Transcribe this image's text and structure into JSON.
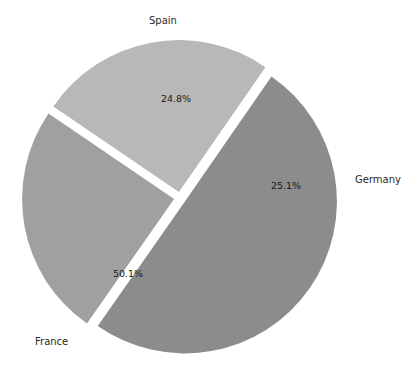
{
  "chart_data": {
    "type": "pie",
    "title": "",
    "categories": [
      "Spain",
      "Germany",
      "France"
    ],
    "values": [
      24.8,
      25.1,
      50.1
    ],
    "value_labels": [
      "24.8%",
      "25.1%",
      "50.1%"
    ],
    "units": "percent",
    "legend": "none",
    "grid": false,
    "exploded": true,
    "slice_colors": [
      "#a0a0a0",
      "#b8b8b8",
      "#8c8c8c"
    ],
    "background_color": "#ffffff",
    "label_color": "#2a2a2a",
    "slices": [
      {
        "name": "Spain",
        "value": 24.8,
        "value_label": "24.8%",
        "color": "#a0a0a0",
        "start_angle": 215,
        "end_angle": 304.3,
        "label_x": 176,
        "label_y": 99,
        "category_label_x": 149,
        "category_label_y": 16
      },
      {
        "name": "Germany",
        "value": 25.1,
        "value_label": "25.1%",
        "color": "#b8b8b8",
        "start_angle": 304.3,
        "end_angle": 34.7,
        "label_x": 286,
        "label_y": 186,
        "category_label_x": 355,
        "category_label_y": 175
      },
      {
        "name": "France",
        "value": 50.1,
        "value_label": "50.1%",
        "color": "#8c8c8c",
        "start_angle": 34.7,
        "end_angle": 215,
        "label_x": 128,
        "label_y": 274,
        "category_label_x": 35,
        "category_label_y": 337
      }
    ],
    "geometry": {
      "center_x": 180,
      "center_y": 198,
      "radius": 152,
      "explode_offset": 6
    }
  }
}
